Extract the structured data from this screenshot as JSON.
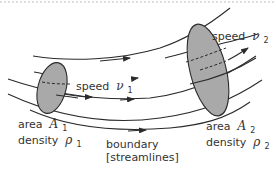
{
  "diagram": {
    "colors": {
      "line": "#2b2b2b",
      "fill": "#a9a9a9",
      "text": "#333333",
      "top_border": "#bdbdbd"
    },
    "labels": {
      "speed1": {
        "word": "speed",
        "symbol": "ν",
        "subscript": "1"
      },
      "speed2": {
        "word": "speed",
        "symbol": "ν",
        "subscript": "2"
      },
      "area1": {
        "word": "area",
        "symbol": "A",
        "subscript": "1"
      },
      "density1": {
        "word": "density",
        "symbol": "ρ",
        "subscript": "1"
      },
      "area2": {
        "word": "area",
        "symbol": "A",
        "subscript": "2"
      },
      "density2": {
        "word": "density",
        "symbol": "ρ",
        "subscript": "2"
      },
      "boundary_line1": "boundary",
      "boundary_line2": "[streamlines]"
    },
    "shapes": {
      "cross_section_1": "small-ellipse",
      "cross_section_2": "large-ellipse",
      "streamlines": 5
    }
  }
}
